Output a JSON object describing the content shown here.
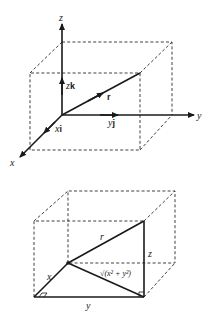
{
  "figure_top": {
    "title": "Position vector in Cartesian coordinates",
    "axes": {
      "x": "x",
      "y": "y",
      "z": "z"
    },
    "components": {
      "x_component": {
        "scalar": "x",
        "unit": "i"
      },
      "y_component": {
        "scalar": "y",
        "unit": "j"
      },
      "z_component": {
        "scalar": "z",
        "unit": "k"
      }
    },
    "vector_label": "r"
  },
  "figure_bottom": {
    "title": "Magnitude of r via Pythagoras",
    "labels": {
      "x": "x",
      "y": "y",
      "z": "z",
      "r": "r",
      "diagonal": "√(x² + y²)"
    }
  },
  "colors": {
    "ink": "#1a1a1a",
    "background": "#ffffff"
  }
}
